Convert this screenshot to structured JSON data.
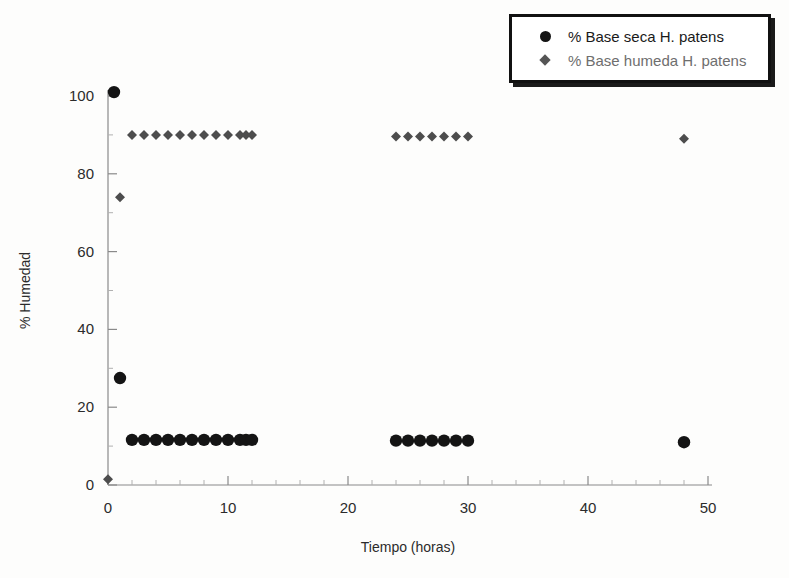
{
  "chart_data": {
    "type": "scatter",
    "title": "",
    "xlabel": "Tiempo (horas)",
    "ylabel": "% Humedad",
    "xlim": [
      0,
      50
    ],
    "ylim": [
      0,
      100
    ],
    "xticks": [
      0,
      10,
      20,
      30,
      40,
      50
    ],
    "yticks": [
      0,
      20,
      40,
      60,
      80,
      100
    ],
    "xtick_labels": [
      "0",
      "10",
      "20",
      "30",
      "40",
      "50"
    ],
    "ytick_labels": [
      "0",
      "20",
      "40",
      "60",
      "80",
      "100"
    ],
    "x_minor_step": 2,
    "y_minor_step": 10,
    "grid": false,
    "legend_position": "top-right",
    "series": [
      {
        "name": "% Base seca H. patens",
        "marker": "circle",
        "color": "#141414",
        "points": [
          [
            0.5,
            101
          ],
          [
            1,
            27.5
          ],
          [
            2,
            11.6
          ],
          [
            3,
            11.6
          ],
          [
            4,
            11.6
          ],
          [
            5,
            11.6
          ],
          [
            6,
            11.6
          ],
          [
            7,
            11.6
          ],
          [
            8,
            11.6
          ],
          [
            9,
            11.6
          ],
          [
            10,
            11.6
          ],
          [
            11,
            11.6
          ],
          [
            11.5,
            11.6
          ],
          [
            12,
            11.6
          ],
          [
            24,
            11.4
          ],
          [
            25,
            11.4
          ],
          [
            26,
            11.4
          ],
          [
            27,
            11.4
          ],
          [
            28,
            11.4
          ],
          [
            29,
            11.4
          ],
          [
            30,
            11.4
          ],
          [
            48,
            11.0
          ]
        ]
      },
      {
        "name": "% Base humeda H. patens",
        "marker": "diamond",
        "color": "#4d4d4d",
        "points": [
          [
            0,
            1.5
          ],
          [
            1,
            74
          ],
          [
            2,
            90
          ],
          [
            3,
            90
          ],
          [
            4,
            90
          ],
          [
            5,
            90
          ],
          [
            6,
            90
          ],
          [
            7,
            90
          ],
          [
            8,
            90
          ],
          [
            9,
            90
          ],
          [
            10,
            90
          ],
          [
            11,
            90
          ],
          [
            11.5,
            90
          ],
          [
            12,
            90
          ],
          [
            24,
            89.6
          ],
          [
            25,
            89.6
          ],
          [
            26,
            89.6
          ],
          [
            27,
            89.6
          ],
          [
            28,
            89.6
          ],
          [
            29,
            89.6
          ],
          [
            30,
            89.6
          ],
          [
            48,
            89.0
          ]
        ]
      }
    ]
  },
  "legend": {
    "entries": [
      {
        "label": "% Base seca H. patens",
        "marker": "circle"
      },
      {
        "label": "% Base humeda H. patens",
        "marker": "diamond"
      }
    ]
  }
}
